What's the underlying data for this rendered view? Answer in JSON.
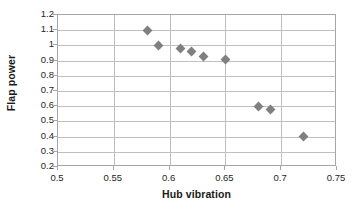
{
  "chart_data": {
    "type": "scatter",
    "title": "",
    "xlabel": "Hub vibration",
    "ylabel": "Flap power",
    "xlim": [
      0.5,
      0.75
    ],
    "ylim": [
      0.2,
      1.2
    ],
    "xticks": [
      "0.5",
      "0.55",
      "0.6",
      "0.65",
      "0.7",
      "0.75"
    ],
    "xtick_values": [
      0.5,
      0.55,
      0.6,
      0.65,
      0.7,
      0.75
    ],
    "yticks": [
      "0.2",
      "0.3",
      "0.4",
      "0.5",
      "0.6",
      "0.7",
      "0.8",
      "0.9",
      "1",
      "1.1",
      "1.2"
    ],
    "ytick_values": [
      0.2,
      0.3,
      0.4,
      0.5,
      0.6,
      0.7,
      0.8,
      0.9,
      1.0,
      1.1,
      1.2
    ],
    "grid": "both",
    "legend": "none",
    "marker": "diamond",
    "marker_color": "#808080",
    "series": [
      {
        "name": "Pareto front",
        "x": [
          0.58,
          0.59,
          0.61,
          0.62,
          0.63,
          0.65,
          0.68,
          0.69,
          0.72
        ],
        "y": [
          1.1,
          1.0,
          0.98,
          0.96,
          0.93,
          0.91,
          0.6,
          0.58,
          0.4
        ]
      }
    ]
  },
  "axes": {
    "x_title": "Hub vibration",
    "y_title": "Flap power"
  },
  "colors": {
    "marker": "#808080",
    "gridline": "#bfbfbf",
    "axis": "#a6a6a6",
    "text": "#262626",
    "background": "#ffffff"
  }
}
